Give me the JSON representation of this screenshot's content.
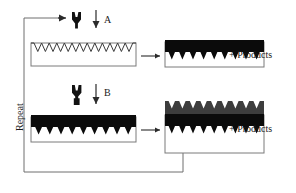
{
  "diagram": {
    "steps": [
      {
        "id": "A",
        "label": "A",
        "reagent_icon": "template-molecule-icon"
      },
      {
        "id": "B",
        "label": "B",
        "reagent_icon": "monomer-molecule-icon"
      }
    ],
    "loop_label": "Repeat",
    "products_label_a": "+ Products",
    "products_label_b": "+ Products",
    "substrates": [
      {
        "name": "empty-sawtooth-substrate",
        "teeth": 8,
        "state": "empty"
      },
      {
        "name": "filled-substrate-a",
        "teeth": 8,
        "state": "filled"
      },
      {
        "name": "filled-substrate-b-input",
        "teeth": 8,
        "state": "filled"
      },
      {
        "name": "double-layer-substrate",
        "teeth": 8,
        "state": "double-layer"
      }
    ],
    "colors": {
      "line": "#2b2b2b",
      "loop": "#6f6f6f",
      "box": "#7a7a7a",
      "filled_layer": "#0b0b0b",
      "upper_layer": "#3d3d3d",
      "background": "#ffffff"
    }
  }
}
